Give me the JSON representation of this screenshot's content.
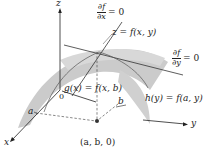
{
  "diagram": {
    "type": "3d-surface-critical-point",
    "axes": {
      "z_label": "z",
      "x_label": "x",
      "y_label": "y",
      "origin_label": "0"
    },
    "labels": {
      "surface": "z = f(x, y)",
      "g_curve": "g(x) = f(x, b)",
      "h_curve": "h(y) = f(a, y)",
      "point": "(a, b, 0)",
      "a_tick": "a",
      "b_tick": "b"
    },
    "partials": {
      "dfdx": {
        "num": "∂f",
        "den": "∂x",
        "eq": "= 0"
      },
      "dfdy": {
        "num": "∂f",
        "den": "∂y",
        "eq": "= 0"
      }
    },
    "colors": {
      "surface_fill": "#c8c8c8",
      "surface_edge": "#9a9a9a",
      "axis": "#222222",
      "tangent": "#333333",
      "dashed": "#555555",
      "point": "#333333"
    }
  }
}
